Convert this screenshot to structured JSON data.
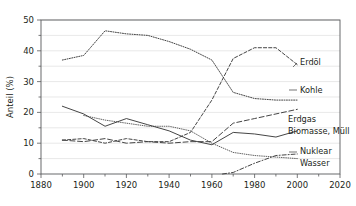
{
  "chart_data": {
    "type": "line",
    "title": "",
    "xlabel": "",
    "ylabel": "Anteil (%)",
    "xlim": [
      1880,
      2020
    ],
    "ylim": [
      0,
      50
    ],
    "grid": true,
    "legend_position": "right-inline",
    "xticks": [
      "1880",
      "1900",
      "1920",
      "1940",
      "1960",
      "1980",
      "2000",
      "2020"
    ],
    "yticks": [
      "0",
      "10",
      "20",
      "30",
      "40",
      "50"
    ],
    "minor_ytick_step": 5,
    "series": [
      {
        "name": "Kohle",
        "label": "Kohle",
        "style": "dotted",
        "color": "#3b3b3b",
        "x": [
          1890,
          1900,
          1910,
          1920,
          1930,
          1940,
          1950,
          1960,
          1970,
          1980,
          1990,
          2000
        ],
        "values": [
          37,
          38.5,
          46.5,
          45.5,
          45,
          43,
          40.5,
          37,
          26.5,
          24.5,
          24,
          24
        ]
      },
      {
        "name": "Erdöl",
        "label": "Erdöl",
        "style": "dashed",
        "color": "#3b3b3b",
        "x": [
          1890,
          1900,
          1910,
          1920,
          1930,
          1940,
          1950,
          1960,
          1970,
          1980,
          1990,
          2000
        ],
        "values": [
          11,
          11.5,
          10,
          11.5,
          10.5,
          10.5,
          13.5,
          24,
          37.5,
          41,
          41,
          35.5
        ]
      },
      {
        "name": "Biomasse, Müll",
        "label": "Biomasse, Müll",
        "style": "solid",
        "color": "#3b3b3b",
        "x": [
          1890,
          1900,
          1910,
          1920,
          1930,
          1940,
          1950,
          1960,
          1970,
          1980,
          1990,
          2000
        ],
        "values": [
          22,
          19.5,
          15.5,
          18,
          16,
          14,
          11,
          9.5,
          13.5,
          13,
          12,
          14
        ]
      },
      {
        "name": "Erdgas",
        "label": "Erdgas",
        "style": "dash-long",
        "color": "#3b3b3b",
        "x": [
          1890,
          1900,
          1910,
          1920,
          1930,
          1940,
          1950,
          1960,
          1970,
          1980,
          1990,
          2000
        ],
        "values": [
          11,
          10.5,
          11.5,
          10,
          10.5,
          10,
          10.5,
          10.5,
          16.5,
          18,
          19.5,
          21
        ]
      },
      {
        "name": "Wasser",
        "label": "Wasser",
        "style": "fine-dotted",
        "color": "#8a8a8a",
        "x": [
          1900,
          1910,
          1920,
          1930,
          1940,
          1950,
          1960,
          1970,
          1980,
          1990,
          2000
        ],
        "values": [
          19,
          17.5,
          16.5,
          15.5,
          15.5,
          14,
          10,
          7,
          6,
          5.5,
          5
        ]
      },
      {
        "name": "Nuklear",
        "label": "Nuklear",
        "style": "dash-dot",
        "color": "#3b3b3b",
        "x": [
          1965,
          1970,
          1980,
          1990,
          2000
        ],
        "values": [
          0,
          0.5,
          3.5,
          6,
          6.5
        ]
      }
    ],
    "labels": [
      {
        "text": "Erdöl",
        "x": 300,
        "y": 65
      },
      {
        "text": "Kohle",
        "x": 300,
        "y": 93
      },
      {
        "text": "Erdgas",
        "x": 288,
        "y": 122
      },
      {
        "text": "Biomasse, Müll",
        "x": 288,
        "y": 134
      },
      {
        "text": "Nuklear",
        "x": 300,
        "y": 154
      },
      {
        "text": "Wasser",
        "x": 300,
        "y": 166
      }
    ]
  }
}
